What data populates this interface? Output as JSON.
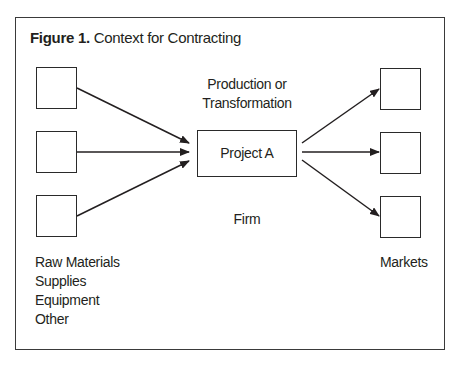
{
  "figure": {
    "title_bold": "Figure 1.",
    "title_rest": " Context for Contracting"
  },
  "center": {
    "top_label_line1": "Production or",
    "top_label_line2": "Transformation",
    "project_label": "Project A",
    "bottom_label": "Firm"
  },
  "inputs": {
    "boxes": 3,
    "labels": [
      "Raw Materials",
      "Supplies",
      "Equipment",
      "Other"
    ]
  },
  "outputs": {
    "boxes": 3,
    "label": "Markets"
  },
  "colors": {
    "stroke": "#2a2a2a",
    "background": "#ffffff",
    "text": "#231f20"
  }
}
